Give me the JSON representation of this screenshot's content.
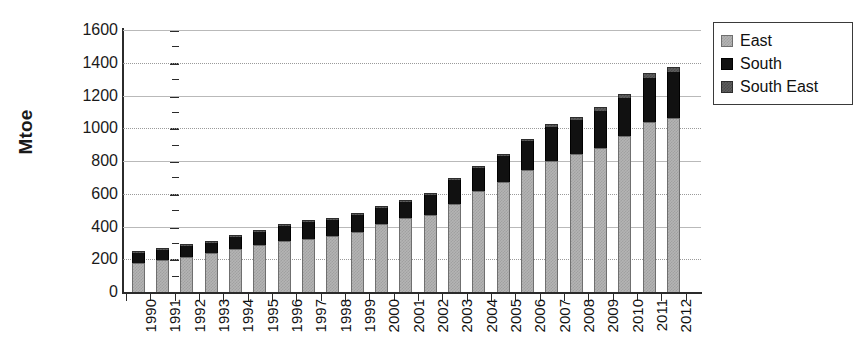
{
  "chart_data": {
    "type": "bar",
    "stacked": true,
    "title": "",
    "xlabel": "",
    "ylabel": "Mtoe",
    "ylim": [
      0,
      1600
    ],
    "ytick_step": 200,
    "yticks": [
      0,
      200,
      400,
      600,
      800,
      1000,
      1200,
      1400,
      1600
    ],
    "ytick_labels": [
      "0",
      "200",
      "400",
      "600",
      "800",
      "1000",
      "1200",
      "1400",
      "1600"
    ],
    "grid": true,
    "legend_position": "top-right",
    "categories": [
      "1990",
      "1991",
      "1992",
      "1993",
      "1994",
      "1995",
      "1996",
      "1997",
      "1998",
      "1999",
      "2000",
      "2001",
      "2002",
      "2003",
      "2004",
      "2005",
      "2006",
      "2007",
      "2008",
      "2009",
      "2010",
      "2011",
      "2012"
    ],
    "series": [
      {
        "name": "East",
        "color": "#b4b4b4",
        "values": [
          180,
          195,
          215,
          240,
          265,
          290,
          310,
          325,
          345,
          365,
          415,
          450,
          470,
          540,
          615,
          670,
          745,
          800,
          845,
          880,
          955,
          1040,
          1065
        ]
      },
      {
        "name": "South",
        "color": "#111111",
        "values": [
          58,
          60,
          65,
          62,
          68,
          75,
          95,
          100,
          95,
          105,
          100,
          100,
          125,
          145,
          140,
          160,
          175,
          210,
          205,
          225,
          230,
          270,
          280
        ]
      },
      {
        "name": "South East",
        "color": "#5e5e5e",
        "values": [
          5,
          5,
          5,
          5,
          5,
          5,
          5,
          5,
          5,
          8,
          10,
          10,
          12,
          12,
          14,
          14,
          15,
          18,
          18,
          22,
          25,
          28,
          32
        ]
      }
    ],
    "totals": [
      243,
      260,
      285,
      307,
      338,
      370,
      410,
      430,
      445,
      478,
      525,
      560,
      607,
      697,
      769,
      844,
      935,
      1028,
      1068,
      1127,
      1210,
      1338,
      1377
    ]
  },
  "legend": {
    "items": [
      {
        "label": "East",
        "swatch": "east-swatch"
      },
      {
        "label": "South",
        "swatch": "south-swatch"
      },
      {
        "label": "South East",
        "swatch": "south-east-swatch"
      }
    ]
  },
  "axis": {
    "y_title": "Mtoe"
  }
}
